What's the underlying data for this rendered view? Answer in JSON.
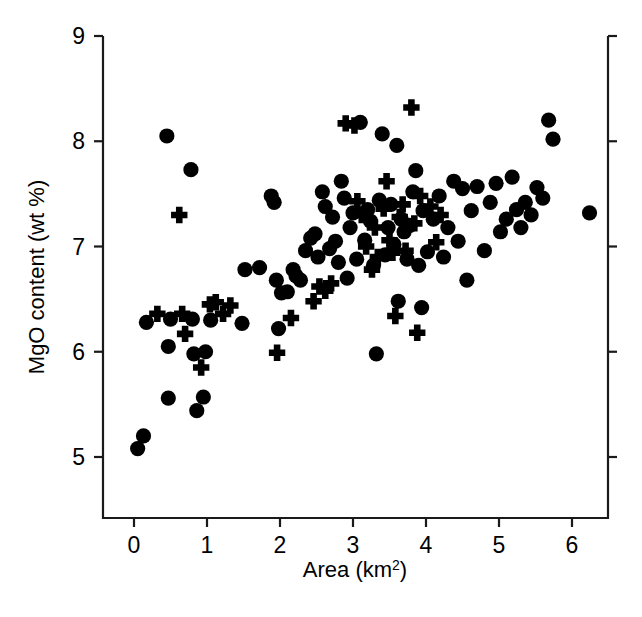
{
  "chart_data": {
    "type": "scatter",
    "title": "",
    "xlabel": "Area (km²)",
    "ylabel": "MgO content (wt %)",
    "xlim": [
      -0.45,
      6.5
    ],
    "ylim": [
      4.42,
      9.0
    ],
    "xticks": [
      0,
      1,
      2,
      3,
      4,
      5,
      6
    ],
    "xtick_labels": [
      "0",
      "1",
      "2",
      "3",
      "4",
      "5",
      "6"
    ],
    "yticks": [
      5,
      6,
      7,
      8,
      9
    ],
    "ytick_labels": [
      "5",
      "6",
      "7",
      "8",
      "9"
    ],
    "grid": false,
    "legend": false,
    "series": [
      {
        "name": "circles",
        "marker": "filled-circle",
        "color": "#000000",
        "points": [
          [
            0.05,
            5.08
          ],
          [
            0.13,
            5.2
          ],
          [
            0.17,
            6.28
          ],
          [
            0.45,
            8.05
          ],
          [
            0.47,
            6.05
          ],
          [
            0.47,
            5.56
          ],
          [
            0.5,
            6.31
          ],
          [
            0.78,
            7.73
          ],
          [
            0.8,
            6.31
          ],
          [
            0.82,
            5.98
          ],
          [
            0.86,
            5.44
          ],
          [
            0.95,
            5.57
          ],
          [
            0.98,
            6.0
          ],
          [
            1.05,
            6.3
          ],
          [
            1.48,
            6.27
          ],
          [
            1.52,
            6.78
          ],
          [
            1.72,
            6.8
          ],
          [
            1.88,
            7.48
          ],
          [
            1.92,
            7.42
          ],
          [
            1.95,
            6.68
          ],
          [
            1.98,
            6.22
          ],
          [
            2.02,
            6.56
          ],
          [
            2.1,
            6.57
          ],
          [
            2.18,
            6.78
          ],
          [
            2.22,
            6.72
          ],
          [
            2.28,
            6.68
          ],
          [
            2.35,
            6.96
          ],
          [
            2.42,
            7.08
          ],
          [
            2.48,
            7.12
          ],
          [
            2.52,
            6.9
          ],
          [
            2.58,
            7.52
          ],
          [
            2.62,
            7.38
          ],
          [
            2.68,
            6.98
          ],
          [
            2.72,
            7.28
          ],
          [
            2.76,
            7.05
          ],
          [
            2.8,
            6.85
          ],
          [
            2.84,
            7.62
          ],
          [
            2.88,
            7.46
          ],
          [
            2.92,
            6.7
          ],
          [
            2.96,
            7.18
          ],
          [
            3.0,
            7.32
          ],
          [
            3.05,
            6.88
          ],
          [
            3.1,
            8.18
          ],
          [
            3.16,
            7.06
          ],
          [
            3.2,
            7.35
          ],
          [
            3.24,
            7.24
          ],
          [
            3.28,
            6.82
          ],
          [
            3.32,
            5.98
          ],
          [
            3.36,
            7.44
          ],
          [
            3.4,
            8.07
          ],
          [
            3.44,
            6.92
          ],
          [
            3.48,
            7.18
          ],
          [
            3.52,
            7.4
          ],
          [
            3.56,
            7.02
          ],
          [
            3.6,
            7.96
          ],
          [
            3.62,
            6.48
          ],
          [
            3.66,
            7.26
          ],
          [
            3.7,
            7.14
          ],
          [
            3.74,
            6.88
          ],
          [
            3.78,
            7.2
          ],
          [
            3.82,
            7.52
          ],
          [
            3.86,
            7.72
          ],
          [
            3.9,
            6.82
          ],
          [
            3.94,
            6.42
          ],
          [
            3.96,
            7.34
          ],
          [
            4.02,
            6.95
          ],
          [
            4.1,
            7.26
          ],
          [
            4.18,
            7.48
          ],
          [
            4.24,
            6.9
          ],
          [
            4.3,
            7.18
          ],
          [
            4.38,
            7.62
          ],
          [
            4.44,
            7.05
          ],
          [
            4.5,
            7.55
          ],
          [
            4.56,
            6.68
          ],
          [
            4.62,
            7.34
          ],
          [
            4.7,
            7.57
          ],
          [
            4.8,
            6.96
          ],
          [
            4.88,
            7.42
          ],
          [
            4.96,
            7.6
          ],
          [
            5.02,
            7.14
          ],
          [
            5.1,
            7.26
          ],
          [
            5.18,
            7.66
          ],
          [
            5.24,
            7.35
          ],
          [
            5.3,
            7.18
          ],
          [
            5.36,
            7.42
          ],
          [
            5.44,
            7.3
          ],
          [
            5.52,
            7.56
          ],
          [
            5.6,
            7.46
          ],
          [
            5.68,
            8.2
          ],
          [
            5.74,
            8.02
          ],
          [
            6.24,
            7.32
          ]
        ]
      },
      {
        "name": "crosses",
        "marker": "plus",
        "color": "#000000",
        "points": [
          [
            0.32,
            6.36
          ],
          [
            0.62,
            7.3
          ],
          [
            0.66,
            6.36
          ],
          [
            0.7,
            6.17
          ],
          [
            0.92,
            5.85
          ],
          [
            1.04,
            6.45
          ],
          [
            1.12,
            6.47
          ],
          [
            1.22,
            6.36
          ],
          [
            1.32,
            6.44
          ],
          [
            1.96,
            5.99
          ],
          [
            2.15,
            6.32
          ],
          [
            2.46,
            6.48
          ],
          [
            2.54,
            6.62
          ],
          [
            2.62,
            6.58
          ],
          [
            2.7,
            6.65
          ],
          [
            2.9,
            8.17
          ],
          [
            3.02,
            8.15
          ],
          [
            3.06,
            7.43
          ],
          [
            3.12,
            7.3
          ],
          [
            3.18,
            7.0
          ],
          [
            3.26,
            6.78
          ],
          [
            3.3,
            7.18
          ],
          [
            3.34,
            6.9
          ],
          [
            3.42,
            7.36
          ],
          [
            3.46,
            7.62
          ],
          [
            3.5,
            7.06
          ],
          [
            3.54,
            6.94
          ],
          [
            3.58,
            6.34
          ],
          [
            3.64,
            7.28
          ],
          [
            3.68,
            7.4
          ],
          [
            3.72,
            6.96
          ],
          [
            3.8,
            8.32
          ],
          [
            3.84,
            7.22
          ],
          [
            3.88,
            6.18
          ],
          [
            3.92,
            7.48
          ],
          [
            4.06,
            7.38
          ],
          [
            4.14,
            7.04
          ],
          [
            4.2,
            7.3
          ]
        ]
      }
    ]
  }
}
